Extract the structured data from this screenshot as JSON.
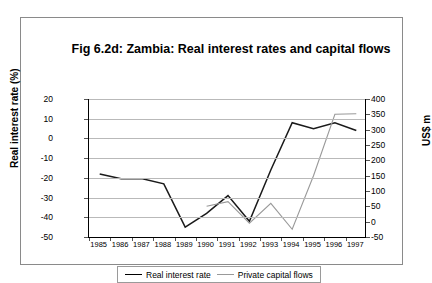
{
  "chart_data": {
    "type": "line",
    "title": "Fig 6.2d: Zambia: Real interest rates and capital flows",
    "xlabel": "",
    "ylabel": "Real interest rate (%)",
    "y2label": "US$ m",
    "categories": [
      "1985",
      "1986",
      "1987",
      "1988",
      "1989",
      "1990",
      "1991",
      "1992",
      "1993",
      "1994",
      "1995",
      "1996",
      "1997"
    ],
    "ylim": [
      -50,
      20
    ],
    "yticks": [
      20,
      10,
      0,
      -10,
      -20,
      -30,
      -40,
      -50
    ],
    "y2lim": [
      -50,
      400
    ],
    "y2ticks": [
      400,
      350,
      300,
      250,
      200,
      150,
      100,
      50,
      0,
      -50
    ],
    "grid": true,
    "legend_position": "bottom",
    "series": [
      {
        "name": "Real interest rate",
        "axis": "left",
        "color": "#1a1a1a",
        "values": [
          -18,
          -20.5,
          -20.5,
          -23,
          -45,
          -38,
          -29,
          -42,
          -16,
          8,
          5,
          8,
          4
        ]
      },
      {
        "name": "Private capital flows",
        "axis": "right",
        "color": "#999999",
        "values": [
          null,
          null,
          null,
          null,
          null,
          50,
          65,
          -5,
          60,
          -25,
          150,
          350,
          352
        ]
      }
    ]
  },
  "legend": {
    "items": [
      {
        "label": "Real interest rate"
      },
      {
        "label": "Private capital flows"
      }
    ]
  }
}
